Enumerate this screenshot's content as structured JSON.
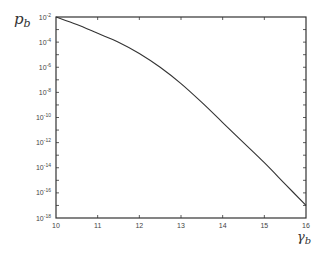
{
  "chart_data": {
    "type": "line",
    "title": "",
    "xlabel": "γ_b",
    "ylabel": "p_b",
    "xlabel_display": {
      "base": "γ",
      "sub": "b"
    },
    "ylabel_display": {
      "base": "p",
      "sub": "b"
    },
    "xlim": [
      10,
      16
    ],
    "ylim": [
      1e-18,
      0.01
    ],
    "yscale": "log",
    "grid": false,
    "legend": null,
    "x_ticks": [
      10,
      11,
      12,
      13,
      14,
      15,
      16
    ],
    "x_tick_labels": [
      "10",
      "11",
      "12",
      "13",
      "14",
      "15",
      "16"
    ],
    "y_ticks_exponents": [
      -2,
      -4,
      -6,
      -8,
      -10,
      -12,
      -14,
      -16,
      -18
    ],
    "y_tick_labels": [
      "10^-2",
      "10^-4",
      "10^-6",
      "10^-8",
      "10^-10",
      "10^-12",
      "10^-14",
      "10^-16",
      "10^-18"
    ],
    "series": [
      {
        "name": "p_b",
        "color": "#333333",
        "x": [
          10,
          10.5,
          11,
          11.5,
          12,
          12.5,
          13,
          13.5,
          14,
          14.5,
          15,
          15.5,
          16
        ],
        "log10_y": [
          -2.0,
          -2.6,
          -3.3,
          -4.0,
          -4.9,
          -6.0,
          -7.3,
          -8.8,
          -10.4,
          -12.0,
          -13.6,
          -15.3,
          -17.0
        ],
        "values": [
          0.01,
          0.0025,
          0.0005,
          0.0001,
          1.3e-05,
          1e-06,
          5e-08,
          1.6e-09,
          4e-11,
          1e-12,
          2.5e-14,
          5e-16,
          1e-17
        ]
      }
    ]
  },
  "plot": {
    "frame_color": "#333333",
    "background": "#ffffff"
  }
}
